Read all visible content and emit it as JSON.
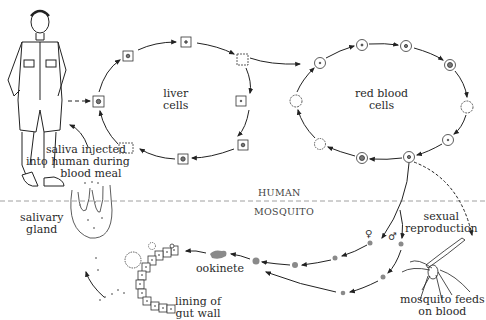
{
  "diagram": {
    "colors": {
      "line": "#222222",
      "parasite_fill": "#8a8a8a",
      "divider": "#888888",
      "background": "#ffffff"
    },
    "regions": {
      "top": "HUMAN",
      "bottom": "MOSQUITO"
    },
    "labels": {
      "liver_cells": [
        "liver",
        "cells"
      ],
      "red_blood_cells": [
        "red blood",
        "cells"
      ],
      "saliva": [
        "saliva injected",
        "into human during",
        "blood meal"
      ],
      "salivary_gland": [
        "salivary",
        "gland"
      ],
      "ookinete": "ookinete",
      "gut_wall": [
        "lining of",
        "gut wall"
      ],
      "sexual_reproduction": [
        "sexual",
        "reproduction"
      ],
      "mosquito_feeds": [
        "mosquito feeds",
        "on blood"
      ],
      "female_symbol": "♀",
      "male_symbol": "♂"
    },
    "cycles": [
      {
        "name": "liver-cycle",
        "stages": 8,
        "cell_shape": "square"
      },
      {
        "name": "red-blood-cycle",
        "stages": 10,
        "cell_shape": "circle"
      }
    ],
    "icons": [
      "human-figure-icon",
      "mosquito-icon",
      "salivary-gland-icon",
      "gut-wall-icon"
    ]
  }
}
